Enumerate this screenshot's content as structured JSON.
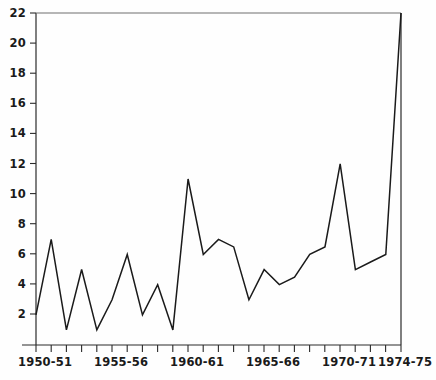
{
  "chart_data": {
    "type": "line",
    "title": "",
    "subtitle": "",
    "xlabel": "",
    "ylabel": "",
    "grid": false,
    "legend": "none",
    "line_color": "#1a1a1a",
    "background_color": "#ffffff",
    "axis_color": "#1a1a1a",
    "xlim": [
      0,
      24
    ],
    "ylim": [
      0,
      22
    ],
    "y_ticks": [
      2,
      4,
      6,
      8,
      10,
      12,
      14,
      16,
      18,
      20,
      22
    ],
    "y_tick_labels": [
      "2",
      "4",
      "6",
      "8",
      "10",
      "12",
      "14",
      "16",
      "18",
      "20",
      "22"
    ],
    "x_tick_labels": [
      "1950-51",
      "1955-56",
      "1960-61",
      "1965-66",
      "1970-71",
      "1974-75"
    ],
    "x_tick_label_indices": [
      0,
      5,
      10,
      15,
      20,
      24
    ],
    "x_minor_tick_count": 25,
    "x": [
      "1950-51",
      "1951-52",
      "1952-53",
      "1953-54",
      "1954-55",
      "1955-56",
      "1956-57",
      "1957-58",
      "1958-59",
      "1959-60",
      "1960-61",
      "1961-62",
      "1962-63",
      "1963-64",
      "1964-65",
      "1965-66",
      "1966-67",
      "1967-68",
      "1968-69",
      "1969-70",
      "1970-71",
      "1971-72",
      "1972-73",
      "1973-74",
      "1974-75"
    ],
    "values": [
      2,
      7,
      1,
      5,
      1,
      3,
      6,
      2,
      4,
      1,
      11,
      6,
      7,
      6.5,
      3,
      5,
      4,
      4.5,
      6,
      6.5,
      12,
      5,
      5.5,
      6,
      22
    ],
    "series": [
      {
        "name": "series-1",
        "values": [
          2,
          7,
          1,
          5,
          1,
          3,
          6,
          2,
          4,
          1,
          11,
          6,
          7,
          6.5,
          3,
          5,
          4,
          4.5,
          6,
          6.5,
          12,
          5,
          5.5,
          6,
          22
        ]
      }
    ]
  },
  "axis": {
    "y_labels": [
      "22",
      "20",
      "18",
      "16",
      "14",
      "12",
      "10",
      "8",
      "6",
      "4",
      "2"
    ],
    "x_labels": [
      "1950-51",
      "1955-56",
      "1960-61",
      "1965-66",
      "1970-71",
      "1974-75"
    ]
  }
}
